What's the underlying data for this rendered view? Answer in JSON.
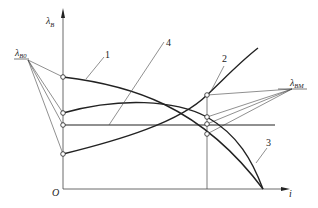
{
  "diagram": {
    "type": "characteristic-curves",
    "axes": {
      "y_label_symbol": "λ",
      "y_label_sub": "B",
      "x_label": "i",
      "origin_label": "O"
    },
    "left_focus": {
      "symbol": "λ",
      "sub": "B0"
    },
    "right_focus": {
      "symbol": "λ",
      "sub": "BM"
    },
    "curve_labels": [
      "1",
      "2",
      "3",
      "4"
    ],
    "colors": {
      "stroke": "#222222",
      "thin": "#444444",
      "background": "#ffffff"
    }
  }
}
